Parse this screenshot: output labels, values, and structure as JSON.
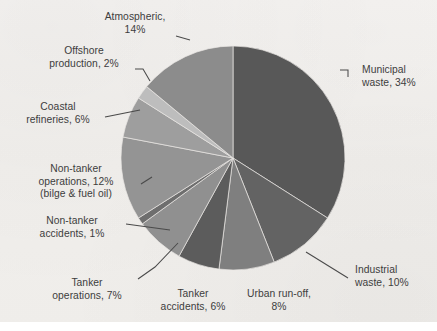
{
  "figure": {
    "background_color": "#f3f1ef",
    "text_color": "#3d3d3d",
    "leader_line_color": "#4a4a4a",
    "slice_border_color": "#e9e7e4"
  },
  "chart_data": {
    "type": "pie",
    "title": "",
    "subtitle": "",
    "xlabel": "",
    "ylabel": "",
    "legend_position": "none",
    "grid": false,
    "start_angle_deg": 0,
    "direction": "clockwise",
    "units": "percent",
    "total": 100,
    "categories": [
      "Municipal waste",
      "Industrial waste",
      "Urban run-off",
      "Tanker accidents",
      "Tanker operations",
      "Non-tanker accidents",
      "Non-tanker operations (bilge & fuel oil)",
      "Coastal refineries",
      "Offshore production",
      "Atmospheric"
    ],
    "values": [
      34,
      10,
      8,
      6,
      7,
      1,
      12,
      6,
      2,
      14
    ],
    "colors": [
      "#585858",
      "#636363",
      "#7f7f7f",
      "#5c5c5c",
      "#909090",
      "#6e6e6e",
      "#949494",
      "#9e9e9e",
      "#bdbdbd",
      "#8c8c8c"
    ],
    "slices": [
      {
        "label": "Municipal waste",
        "value": 34,
        "display": "Municipal\nwaste, 34%",
        "color": "#585858"
      },
      {
        "label": "Industrial waste",
        "value": 10,
        "display": "Industrial\nwaste, 10%",
        "color": "#636363"
      },
      {
        "label": "Urban run-off",
        "value": 8,
        "display": "Urban run-off,\n8%",
        "color": "#7f7f7f"
      },
      {
        "label": "Tanker accidents",
        "value": 6,
        "display": "Tanker\naccidents, 6%",
        "color": "#5c5c5c"
      },
      {
        "label": "Tanker operations",
        "value": 7,
        "display": "Tanker\noperations, 7%",
        "color": "#909090"
      },
      {
        "label": "Non-tanker accidents",
        "value": 1,
        "display": "Non-tanker\naccidents, 1%",
        "color": "#6e6e6e"
      },
      {
        "label": "Non-tanker operations",
        "value": 12,
        "display": "Non-tanker\noperations, 12%\n(bilge & fuel oil)",
        "color": "#949494"
      },
      {
        "label": "Coastal refineries",
        "value": 6,
        "display": "Coastal\nrefineries, 6%",
        "color": "#9e9e9e"
      },
      {
        "label": "Offshore production",
        "value": 2,
        "display": "Offshore\nproduction, 2%",
        "color": "#bdbdbd"
      },
      {
        "label": "Atmospheric",
        "value": 14,
        "display": "Atmospheric,\n14%",
        "color": "#8c8c8c"
      }
    ]
  },
  "labels": {
    "municipal_waste": "Municipal\nwaste, 34%",
    "industrial_waste": "Industrial\nwaste, 10%",
    "urban_runoff": "Urban run-off,\n8%",
    "tanker_accidents": "Tanker\naccidents, 6%",
    "tanker_operations": "Tanker\noperations, 7%",
    "non_tanker_accidents": "Non-tanker\naccidents, 1%",
    "non_tanker_operations": "Non-tanker\noperations, 12%\n(bilge & fuel oil)",
    "coastal_refineries": "Coastal\nrefineries, 6%",
    "offshore_production": "Offshore\nproduction, 2%",
    "atmospheric": "Atmospheric,\n14%"
  }
}
